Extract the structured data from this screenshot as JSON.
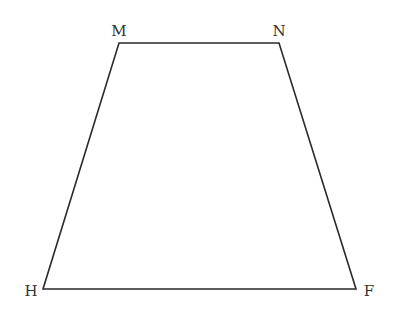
{
  "diagram": {
    "type": "trapezoid",
    "stroke_color": "#2a2a2a",
    "label_color": "#333333",
    "vertices": [
      {
        "name": "M",
        "x": 119,
        "y": 43,
        "label_x": 119,
        "label_y": 36
      },
      {
        "name": "N",
        "x": 279,
        "y": 43,
        "label_x": 279,
        "label_y": 36
      },
      {
        "name": "F",
        "x": 356,
        "y": 289,
        "label_x": 369,
        "label_y": 296
      },
      {
        "name": "H",
        "x": 43,
        "y": 289,
        "label_x": 31,
        "label_y": 296
      }
    ],
    "labels": {
      "M": "M",
      "N": "N",
      "F": "F",
      "H": "H"
    }
  }
}
